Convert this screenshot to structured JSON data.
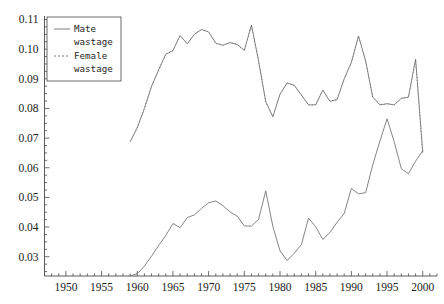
{
  "chart_data": {
    "type": "line",
    "title": "",
    "xlabel": "",
    "ylabel": "",
    "xlim": [
      1947,
      2002
    ],
    "ylim": [
      0.0235,
      0.1105
    ],
    "grid": false,
    "legend_position": "top-left",
    "xticks": [
      1950,
      1955,
      1960,
      1965,
      1970,
      1975,
      1980,
      1985,
      1990,
      1995,
      2000
    ],
    "xtick_labels": [
      "1950",
      "1955",
      "1960",
      "1965",
      "1970",
      "1975",
      "1980",
      "1985",
      "1990",
      "1995",
      "2000"
    ],
    "xtick_minor_step": 1,
    "yticks": [
      0.03,
      0.04,
      0.05,
      0.06,
      0.07,
      0.08,
      0.09,
      0.1,
      0.11
    ],
    "ytick_labels": [
      "0.03",
      "0.04",
      "0.05",
      "0.06",
      "0.07",
      "0.08",
      "0.09",
      "0.10",
      "0.11"
    ],
    "ytick_minor_step": 0.0025,
    "series": [
      {
        "name": "Mate wastage",
        "style": "solid",
        "color": "#6f6f6f",
        "x": [
          1959,
          1960,
          1961,
          1962,
          1963,
          1964,
          1965,
          1966,
          1967,
          1968,
          1969,
          1970,
          1971,
          1972,
          1973,
          1974,
          1975,
          1976,
          1977,
          1978,
          1979,
          1980,
          1981,
          1982,
          1983,
          1984,
          1985,
          1986,
          1987,
          1988,
          1989,
          1990,
          1991,
          1992,
          1993,
          1994,
          1995,
          1996,
          1997,
          1998,
          1999,
          2000
        ],
        "values": [
          0.0235,
          0.0243,
          0.0268,
          0.0302,
          0.0338,
          0.0372,
          0.0412,
          0.0398,
          0.0432,
          0.0441,
          0.0463,
          0.0482,
          0.0488,
          0.0472,
          0.0451,
          0.0437,
          0.0404,
          0.0403,
          0.0426,
          0.0522,
          0.0402,
          0.032,
          0.0287,
          0.0312,
          0.0341,
          0.043,
          0.0401,
          0.0358,
          0.0382,
          0.0416,
          0.0446,
          0.053,
          0.0512,
          0.0516,
          0.061,
          0.069,
          0.0765,
          0.0688,
          0.0597,
          0.058,
          0.0622,
          0.0658
        ]
      },
      {
        "name": "Female wastage",
        "style": "dashed",
        "color": "#8a8a8a",
        "x": [
          1959,
          1960,
          1961,
          1962,
          1963,
          1964,
          1965,
          1966,
          1967,
          1968,
          1969,
          1970,
          1971,
          1972,
          1973,
          1974,
          1975,
          1976,
          1977,
          1978,
          1979,
          1980,
          1981,
          1982,
          1983,
          1984,
          1985,
          1986,
          1987,
          1988,
          1989,
          1990,
          1991,
          1992,
          1993,
          1994,
          1995,
          1996,
          1997,
          1998,
          1999,
          2000
        ],
        "values": [
          0.0688,
          0.0735,
          0.08,
          0.0875,
          0.093,
          0.0983,
          0.0995,
          0.1046,
          0.1018,
          0.105,
          0.1066,
          0.1058,
          0.102,
          0.1013,
          0.1022,
          0.1016,
          0.0996,
          0.1081,
          0.096,
          0.0823,
          0.0772,
          0.0848,
          0.0886,
          0.0878,
          0.0845,
          0.0812,
          0.0812,
          0.0862,
          0.0824,
          0.083,
          0.09,
          0.0955,
          0.1044,
          0.096,
          0.0838,
          0.0812,
          0.0816,
          0.0812,
          0.0834,
          0.0838,
          0.0966,
          0.0652
        ]
      }
    ],
    "annotations": []
  },
  "legend": {
    "items": [
      {
        "label_line1": "Mate",
        "label_line2": "wastage",
        "style": "solid"
      },
      {
        "label_line1": "Female",
        "label_line2": "wastage",
        "style": "dashed"
      }
    ]
  },
  "colors": {
    "background": "#ffffff",
    "axis": "#4a4a4a",
    "male_line": "#6f6f6f",
    "female_line": "#8a8a8a",
    "text": "#222222"
  }
}
